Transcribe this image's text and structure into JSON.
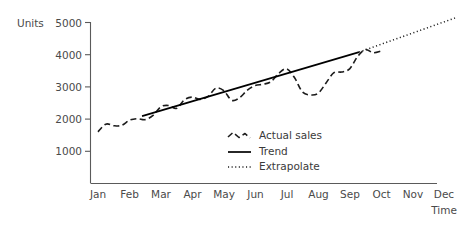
{
  "chart_data": {
    "type": "line",
    "title": "",
    "subtitle": "",
    "xlabel": "Time",
    "ylabel": "Units",
    "categories": [
      "Jan",
      "Feb",
      "Mar",
      "Apr",
      "May",
      "Jun",
      "Jul",
      "Aug",
      "Sep",
      "Oct",
      "Nov",
      "Dec"
    ],
    "x_tick_labels": [
      "Jan",
      "Feb",
      "Mar",
      "Apr",
      "May",
      "Jun",
      "Jul",
      "Aug",
      "Sep",
      "Oct",
      "Nov",
      "Dec"
    ],
    "y_tick_labels": [
      "1000",
      "2000",
      "3000",
      "4000",
      "5000"
    ],
    "y_ticks": [
      1000,
      2000,
      3000,
      4000,
      5000
    ],
    "ylim": [
      0,
      5200
    ],
    "xlim": [
      0,
      11
    ],
    "grid": false,
    "legend_position": "center",
    "series": [
      {
        "name": "Actual sales",
        "style": "dashed",
        "color": "#1c1c1c",
        "x": [
          0,
          0.25,
          0.5,
          0.75,
          1,
          1.25,
          1.5,
          1.75,
          2,
          2.25,
          2.5,
          2.75,
          3,
          3.25,
          3.5,
          3.75,
          4,
          4.25,
          4.5,
          4.75,
          5,
          5.25,
          5.5,
          5.75,
          6,
          6.25,
          6.5,
          6.75,
          7,
          7.25,
          7.5,
          7.75,
          8,
          8.25,
          8.5,
          8.75,
          9
        ],
        "values": [
          1600,
          1840,
          1790,
          1800,
          1960,
          2010,
          1980,
          2110,
          2380,
          2420,
          2330,
          2600,
          2680,
          2610,
          2700,
          2960,
          2880,
          2580,
          2660,
          2900,
          3040,
          3080,
          3160,
          3420,
          3560,
          3280,
          2840,
          2750,
          2800,
          3120,
          3440,
          3460,
          3560,
          3940,
          4160,
          4060,
          4110
        ]
      },
      {
        "name": "Trend",
        "style": "solid",
        "color": "#000000",
        "x": [
          1.4,
          8.3
        ],
        "values": [
          2090,
          4080
        ]
      },
      {
        "name": "Extrapolate",
        "style": "dotted",
        "color": "#1c1c1c",
        "x": [
          8.3,
          11.35
        ],
        "values": [
          4080,
          5140
        ]
      }
    ],
    "annotations": [
      {
        "text": "Actual sales peak",
        "value": 4750,
        "x": "Oct"
      },
      {
        "text": "Actual sales trough",
        "value": 2750,
        "x": "Jul"
      }
    ]
  },
  "legend": {
    "items": [
      {
        "label": "Actual sales",
        "style": "dashed"
      },
      {
        "label": "Trend",
        "style": "solid"
      },
      {
        "label": "Extrapolate",
        "style": "dotted"
      }
    ]
  },
  "axes": {
    "y_axis_title": "Units",
    "x_axis_title": "Time"
  }
}
